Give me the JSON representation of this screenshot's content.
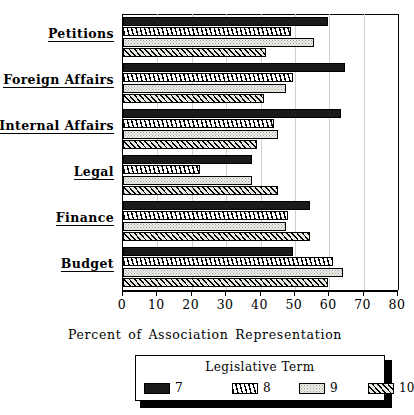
{
  "chart_data": {
    "type": "bar",
    "orientation": "horizontal",
    "title": "",
    "xlabel": "Percent of Association Representation",
    "ylabel": "",
    "xlim": [
      0,
      80
    ],
    "xticks": [
      0,
      10,
      20,
      30,
      40,
      50,
      60,
      70,
      80
    ],
    "xtick_labels": [
      "0",
      "10",
      "20",
      "30",
      "40",
      "50",
      "60",
      "70",
      "80"
    ],
    "grid": true,
    "grid_axis": "x",
    "legend_title": "Legislative Term",
    "legend_position": "below-axis",
    "categories": [
      "Petitions",
      "Foreign Affairs",
      "Internal Affairs",
      "Legal",
      "Finance",
      "Budget"
    ],
    "series": [
      {
        "name": "7",
        "pattern": "solid-black",
        "values": [
          59.5,
          64.5,
          63.5,
          37.5,
          54.5,
          49.5
        ]
      },
      {
        "name": "8",
        "pattern": "narrow-hatch",
        "values": [
          49.0,
          49.5,
          44.0,
          22.5,
          48.0,
          61.0
        ]
      },
      {
        "name": "9",
        "pattern": "light-dotted",
        "values": [
          55.5,
          47.5,
          45.0,
          37.5,
          47.5,
          64.0
        ]
      },
      {
        "name": "10",
        "pattern": "diagonal-hatch",
        "values": [
          41.5,
          41.0,
          39.0,
          45.0,
          54.5,
          59.5
        ]
      }
    ]
  },
  "legend": {
    "title": "Legislative Term",
    "items": [
      {
        "label": "7",
        "swatch": "solid-black"
      },
      {
        "label": "8",
        "swatch": "narrow-hatch"
      },
      {
        "label": "9",
        "swatch": "light-dotted"
      },
      {
        "label": "10",
        "swatch": "diagonal-hatch"
      }
    ]
  },
  "axis": {
    "x_title": "Percent of Association Representation"
  },
  "colors": {
    "series_7": "#1a1a1a",
    "series_8": "#ffffff",
    "series_9": "#f0efe9",
    "series_10": "#e8e7e1",
    "gridline": "#cfcfcf",
    "axis": "#000000",
    "background": "#ffffff"
  }
}
